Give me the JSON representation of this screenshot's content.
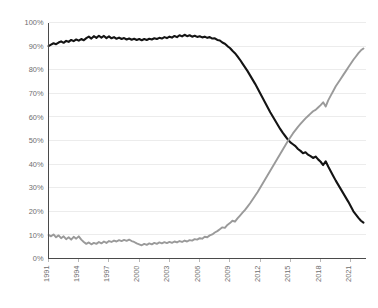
{
  "chart_data": {
    "type": "line",
    "title": "",
    "subtitle": "",
    "xlabel": "",
    "ylabel": "",
    "grid": true,
    "legend_position": "none",
    "xlim": [
      1991,
      2022.5
    ],
    "ylim": [
      0,
      100
    ],
    "x_tick_labels": [
      "1991",
      "1994",
      "1997",
      "2000",
      "2003",
      "2006",
      "2009",
      "2012",
      "2015",
      "2018",
      "2021"
    ],
    "x_tick_values": [
      1991,
      1994,
      1997,
      2000,
      2003,
      2006,
      2009,
      2012,
      2015,
      2018,
      2021
    ],
    "y_tick_labels": [
      "0%",
      "10%",
      "20%",
      "30%",
      "40%",
      "50%",
      "60%",
      "70%",
      "80%",
      "90%",
      "100%"
    ],
    "y_tick_values": [
      0,
      10,
      20,
      30,
      40,
      50,
      60,
      70,
      80,
      90,
      100
    ],
    "colors": {
      "series_declining": "#141414",
      "series_rising": "#9a9a9a",
      "gridline": "#ececec",
      "axis": "#4a4a4a",
      "tick_text": "#6e6e6e",
      "background": "#ffffff"
    },
    "series": [
      {
        "name": "declining-series",
        "color": "#141414",
        "x": [
          1991.0,
          1991.25,
          1991.5,
          1991.75,
          1992.0,
          1992.25,
          1992.5,
          1992.75,
          1993.0,
          1993.25,
          1993.5,
          1993.75,
          1994.0,
          1994.25,
          1994.5,
          1994.75,
          1995.0,
          1995.25,
          1995.5,
          1995.75,
          1996.0,
          1996.25,
          1996.5,
          1996.75,
          1997.0,
          1997.25,
          1997.5,
          1997.75,
          1998.0,
          1998.25,
          1998.5,
          1998.75,
          1999.0,
          1999.25,
          1999.5,
          1999.75,
          2000.0,
          2000.25,
          2000.5,
          2000.75,
          2001.0,
          2001.25,
          2001.5,
          2001.75,
          2002.0,
          2002.25,
          2002.5,
          2002.75,
          2003.0,
          2003.25,
          2003.5,
          2003.75,
          2004.0,
          2004.25,
          2004.5,
          2004.75,
          2005.0,
          2005.25,
          2005.5,
          2005.75,
          2006.0,
          2006.25,
          2006.5,
          2006.75,
          2007.0,
          2007.25,
          2007.5,
          2007.75,
          2008.0,
          2008.25,
          2008.5,
          2008.75,
          2009.0,
          2009.25,
          2009.5,
          2009.75,
          2010.0,
          2010.25,
          2010.5,
          2010.75,
          2011.0,
          2011.25,
          2011.5,
          2011.75,
          2012.0,
          2012.25,
          2012.5,
          2012.75,
          2013.0,
          2013.25,
          2013.5,
          2013.75,
          2014.0,
          2014.25,
          2014.5,
          2014.75,
          2015.0,
          2015.25,
          2015.5,
          2015.75,
          2016.0,
          2016.25,
          2016.5,
          2016.75,
          2017.0,
          2017.25,
          2017.5,
          2017.75,
          2018.0,
          2018.25,
          2018.5,
          2018.75,
          2019.0,
          2019.25,
          2019.5,
          2019.75,
          2020.0,
          2020.25,
          2020.5,
          2020.75,
          2021.0,
          2021.25,
          2021.5,
          2021.75,
          2022.0,
          2022.25
        ],
        "y": [
          90.0,
          90.6,
          91.2,
          90.8,
          91.5,
          92.0,
          91.4,
          92.2,
          91.8,
          92.6,
          92.1,
          92.8,
          92.3,
          93.0,
          92.5,
          93.4,
          94.0,
          93.2,
          94.2,
          93.5,
          94.4,
          93.6,
          94.3,
          93.4,
          94.1,
          93.3,
          93.8,
          93.1,
          93.6,
          93.0,
          93.4,
          92.8,
          93.2,
          92.7,
          93.1,
          92.6,
          93.0,
          92.5,
          93.0,
          92.6,
          93.1,
          92.8,
          93.3,
          93.0,
          93.5,
          93.2,
          93.8,
          93.4,
          94.0,
          93.6,
          94.3,
          93.8,
          94.6,
          94.1,
          94.8,
          94.2,
          94.6,
          94.0,
          94.4,
          93.9,
          94.2,
          93.7,
          94.0,
          93.5,
          93.8,
          93.2,
          93.3,
          92.6,
          92.4,
          91.5,
          91.0,
          90.0,
          89.2,
          88.0,
          87.0,
          85.6,
          84.2,
          82.6,
          81.0,
          79.4,
          77.6,
          75.8,
          74.0,
          72.0,
          70.0,
          68.0,
          66.0,
          64.0,
          62.0,
          60.2,
          58.4,
          56.6,
          54.8,
          53.2,
          51.8,
          50.4,
          49.2,
          48.4,
          47.6,
          46.4,
          45.6,
          44.6,
          45.0,
          44.0,
          43.4,
          42.6,
          43.2,
          42.0,
          41.0,
          39.6,
          41.2,
          39.0,
          37.0,
          35.0,
          33.0,
          31.2,
          29.4,
          27.6,
          25.8,
          24.0,
          22.0,
          20.0,
          18.6,
          17.2,
          16.0,
          15.2
        ],
        "start_value": 90.0,
        "peak_value": 94.8,
        "end_value": 9.2
      },
      {
        "name": "rising-series",
        "color": "#9a9a9a",
        "x": [
          1991.0,
          1991.25,
          1991.5,
          1991.75,
          1992.0,
          1992.25,
          1992.5,
          1992.75,
          1993.0,
          1993.25,
          1993.5,
          1993.75,
          1994.0,
          1994.25,
          1994.5,
          1994.75,
          1995.0,
          1995.25,
          1995.5,
          1995.75,
          1996.0,
          1996.25,
          1996.5,
          1996.75,
          1997.0,
          1997.25,
          1997.5,
          1997.75,
          1998.0,
          1998.25,
          1998.5,
          1998.75,
          1999.0,
          1999.25,
          1999.5,
          1999.75,
          2000.0,
          2000.25,
          2000.5,
          2000.75,
          2001.0,
          2001.25,
          2001.5,
          2001.75,
          2002.0,
          2002.25,
          2002.5,
          2002.75,
          2003.0,
          2003.25,
          2003.5,
          2003.75,
          2004.0,
          2004.25,
          2004.5,
          2004.75,
          2005.0,
          2005.25,
          2005.5,
          2005.75,
          2006.0,
          2006.25,
          2006.5,
          2006.75,
          2007.0,
          2007.25,
          2007.5,
          2007.75,
          2008.0,
          2008.25,
          2008.5,
          2008.75,
          2009.0,
          2009.25,
          2009.5,
          2009.75,
          2010.0,
          2010.25,
          2010.5,
          2010.75,
          2011.0,
          2011.25,
          2011.5,
          2011.75,
          2012.0,
          2012.25,
          2012.5,
          2012.75,
          2013.0,
          2013.25,
          2013.5,
          2013.75,
          2014.0,
          2014.25,
          2014.5,
          2014.75,
          2015.0,
          2015.25,
          2015.5,
          2015.75,
          2016.0,
          2016.25,
          2016.5,
          2016.75,
          2017.0,
          2017.25,
          2017.5,
          2017.75,
          2018.0,
          2018.25,
          2018.5,
          2018.75,
          2019.0,
          2019.25,
          2019.5,
          2019.75,
          2020.0,
          2020.25,
          2020.5,
          2020.75,
          2021.0,
          2021.25,
          2021.5,
          2021.75,
          2022.0,
          2022.25
        ],
        "y": [
          10.0,
          9.4,
          10.2,
          9.0,
          9.8,
          8.6,
          9.4,
          8.2,
          9.0,
          8.0,
          9.2,
          8.4,
          9.4,
          8.0,
          7.0,
          6.2,
          6.8,
          6.0,
          6.6,
          6.2,
          7.0,
          6.4,
          7.2,
          6.6,
          7.4,
          7.0,
          7.6,
          7.2,
          7.8,
          7.4,
          7.9,
          7.5,
          8.0,
          7.4,
          7.0,
          6.4,
          6.0,
          5.6,
          6.2,
          5.8,
          6.4,
          6.0,
          6.6,
          6.2,
          6.8,
          6.4,
          6.9,
          6.5,
          7.0,
          6.6,
          7.2,
          6.8,
          7.4,
          7.0,
          7.6,
          7.2,
          7.8,
          7.6,
          8.2,
          8.0,
          8.6,
          8.4,
          9.2,
          9.0,
          9.8,
          10.2,
          11.0,
          11.6,
          12.4,
          13.2,
          13.0,
          14.2,
          15.0,
          16.0,
          15.6,
          17.0,
          18.2,
          19.4,
          20.6,
          22.0,
          23.4,
          25.0,
          26.6,
          28.2,
          30.0,
          31.8,
          33.6,
          35.4,
          37.2,
          39.0,
          40.8,
          42.6,
          44.4,
          46.2,
          48.0,
          49.8,
          51.4,
          53.0,
          54.4,
          55.8,
          57.0,
          58.2,
          59.4,
          60.4,
          61.4,
          62.4,
          63.0,
          64.0,
          65.0,
          66.2,
          64.4,
          67.0,
          69.0,
          71.0,
          73.0,
          74.6,
          76.2,
          77.8,
          79.4,
          81.0,
          82.6,
          84.2,
          85.6,
          87.0,
          88.2,
          89.0
        ],
        "start_value": 10.0,
        "end_value": 91.0
      }
    ],
    "crossover": {
      "x": 2015.0,
      "y": 50.4
    }
  }
}
